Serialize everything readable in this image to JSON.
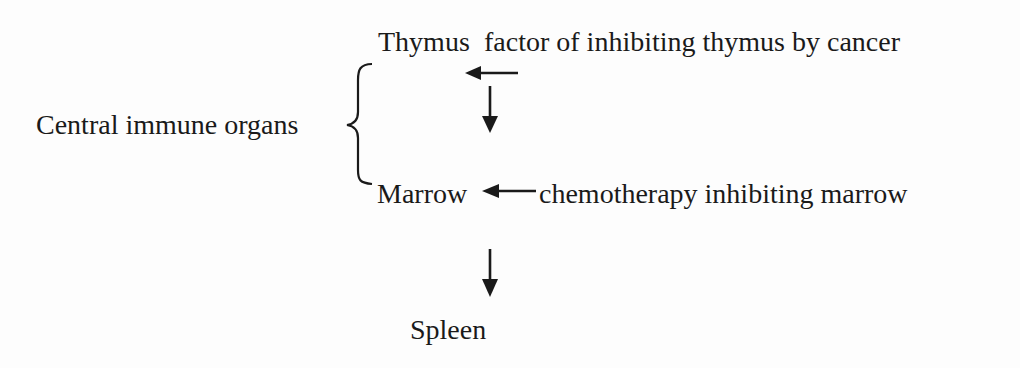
{
  "diagram": {
    "nodes": {
      "thymus": "Thymus",
      "marrow": "Marrow",
      "spleen": "Spleen",
      "group": "Central immune organs"
    },
    "annotations": {
      "thymus_inhibitor": "factor of inhibiting thymus by cancer",
      "marrow_inhibitor": "chemotherapy inhibiting marrow"
    },
    "edges": [
      {
        "from": "factor of inhibiting thymus by cancer",
        "to": "Thymus",
        "type": "inhibits"
      },
      {
        "from": "Thymus",
        "to": "Marrow",
        "type": "flow"
      },
      {
        "from": "chemotherapy inhibiting marrow",
        "to": "Marrow",
        "type": "inhibits"
      },
      {
        "from": "Marrow",
        "to": "Spleen",
        "type": "flow"
      }
    ],
    "grouping": {
      "label": "Central immune organs",
      "members": [
        "Thymus",
        "Marrow"
      ]
    },
    "colors": {
      "ink": "#1a1a1a",
      "background": "#fdfdfd"
    }
  }
}
